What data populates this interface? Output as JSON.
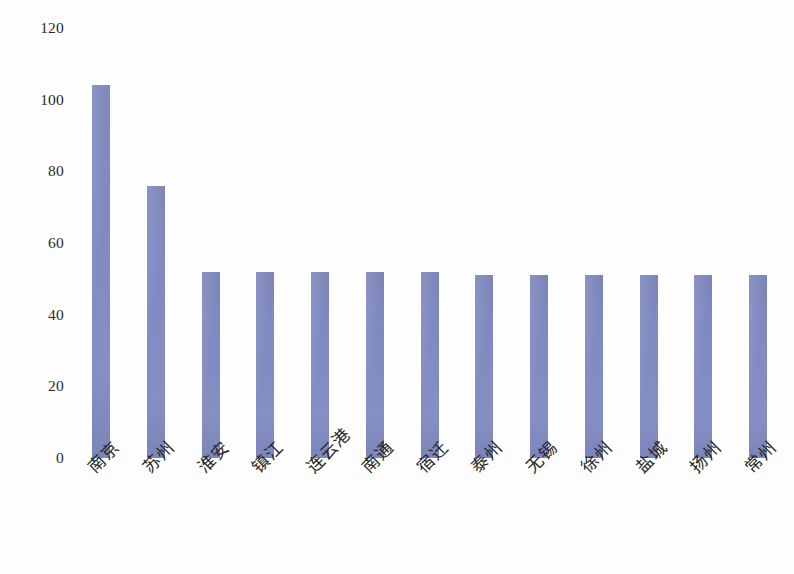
{
  "chart_data": {
    "type": "bar",
    "title": "",
    "subtitle": "",
    "xlabel": "",
    "ylabel": "",
    "ylim": [
      0,
      120
    ],
    "yticks": [
      0,
      20,
      40,
      60,
      80,
      100,
      120
    ],
    "grid": false,
    "legend": null,
    "legend_position": "none",
    "categories": [
      "南京",
      "苏州",
      "淮安",
      "镇江",
      "连云港",
      "南通",
      "宿迁",
      "泰州",
      "无锡",
      "徐州",
      "盐城",
      "扬州",
      "常州"
    ],
    "values": [
      104,
      76,
      52,
      52,
      52,
      52,
      52,
      51,
      51,
      51,
      51,
      51,
      51
    ],
    "series": [
      {
        "name": "",
        "values": [
          104,
          76,
          52,
          52,
          52,
          52,
          52,
          51,
          51,
          51,
          51,
          51,
          51
        ]
      }
    ]
  },
  "style": {
    "bar_color": "#7f89c0",
    "bar_edge_color": "#7f89c0",
    "text_color": "#262626",
    "background": "#ffffff"
  }
}
